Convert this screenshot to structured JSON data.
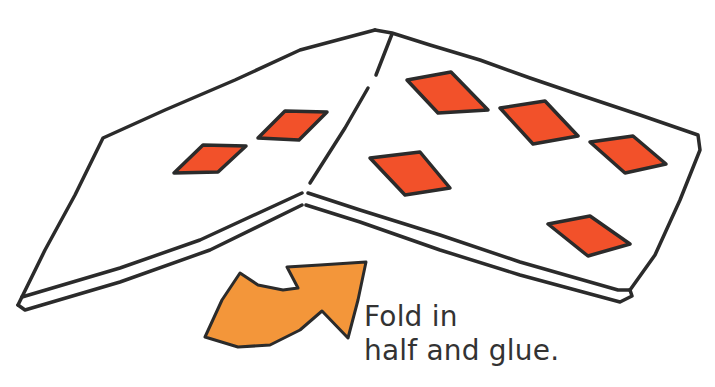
{
  "diagram": {
    "type": "craft-instruction-illustration",
    "colors": {
      "outline": "#2b2b2b",
      "diamond_fill": "#f2512a",
      "arrow_fill": "#f3963a",
      "text": "#333333",
      "background": "#ffffff"
    },
    "left_panel": {
      "diamond_count": 2
    },
    "right_panel": {
      "diamond_count": 5
    },
    "arrow": {
      "direction": "curved-up-right",
      "meaning": "fold"
    }
  },
  "caption": {
    "line1": "Fold in",
    "line2": "half and glue."
  }
}
